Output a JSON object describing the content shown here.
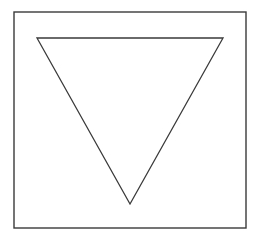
{
  "figure": {
    "background": "#ffffff",
    "stroke_color": "#3a3a3a",
    "frame": {
      "x": 14,
      "y": 12,
      "width": 232,
      "height": 216,
      "stroke_width": 1.4
    },
    "triangle": {
      "orientation": "inverted",
      "points": "37,38 223,38 130,204",
      "stroke_width": 1.3
    }
  }
}
